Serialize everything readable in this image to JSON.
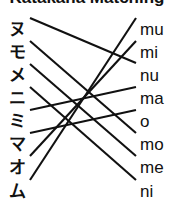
{
  "title": "Katakana Matching",
  "left_column": {
    "label": "katakana-column",
    "items": [
      {
        "char": "ヌ",
        "y": 11
      },
      {
        "char": "モ",
        "y": 34
      },
      {
        "char": "メ",
        "y": 57
      },
      {
        "char": "ニ",
        "y": 80
      },
      {
        "char": "ミ",
        "y": 103
      },
      {
        "char": "マ",
        "y": 126
      },
      {
        "char": "オ",
        "y": 149
      },
      {
        "char": "ム",
        "y": 173
      }
    ]
  },
  "right_column": {
    "label": "romaji-column",
    "items": [
      {
        "text": "mu",
        "y": 11
      },
      {
        "text": "mi",
        "y": 34
      },
      {
        "text": "nu",
        "y": 57
      },
      {
        "text": "ma",
        "y": 80
      },
      {
        "text": "o",
        "y": 103
      },
      {
        "text": "mo",
        "y": 126
      },
      {
        "text": "me",
        "y": 149
      },
      {
        "text": "ni",
        "y": 173
      }
    ]
  },
  "connections": [
    {
      "from": "ヌ",
      "to": "nu",
      "x1": 30,
      "y1": 11,
      "x2": 136,
      "y2": 56
    },
    {
      "from": "モ",
      "to": "mo",
      "x1": 30,
      "y1": 34,
      "x2": 136,
      "y2": 126
    },
    {
      "from": "メ",
      "to": "me",
      "x1": 30,
      "y1": 57,
      "x2": 136,
      "y2": 149
    },
    {
      "from": "ニ",
      "to": "ni",
      "x1": 30,
      "y1": 80,
      "x2": 136,
      "y2": 173
    },
    {
      "from": "ミ",
      "to": "ma",
      "x1": 30,
      "y1": 103,
      "x2": 136,
      "y2": 80
    },
    {
      "from": "マ",
      "to": "o",
      "x1": 30,
      "y1": 126,
      "x2": 136,
      "y2": 103
    },
    {
      "from": "オ",
      "to": "mi",
      "x1": 30,
      "y1": 149,
      "x2": 136,
      "y2": 34
    },
    {
      "from": "ム",
      "to": "mu",
      "x1": 30,
      "y1": 173,
      "x2": 136,
      "y2": 11
    }
  ],
  "colors": {
    "ink": "#111111",
    "background": "#ffffff"
  }
}
